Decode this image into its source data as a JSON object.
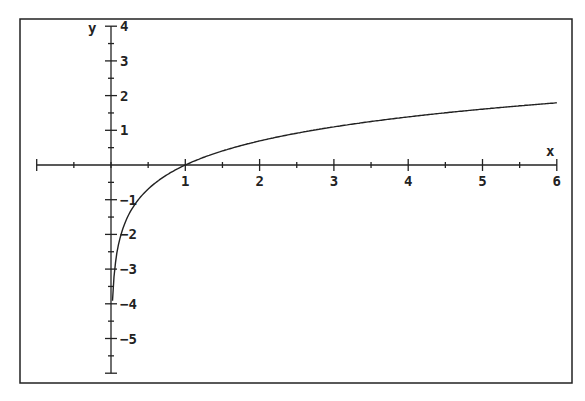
{
  "chart_data": {
    "type": "line",
    "title": "",
    "xlabel": "x",
    "ylabel": "y",
    "function": "y = ln(x)",
    "xlim": [
      -1,
      6
    ],
    "ylim": [
      -6,
      4
    ],
    "x_ticks": [
      1,
      2,
      3,
      4,
      5,
      6
    ],
    "y_ticks": [
      4,
      3,
      2,
      1,
      -1,
      -2,
      -3,
      -4,
      -5
    ],
    "x_tick_labels": [
      "1",
      "2",
      "3",
      "4",
      "5",
      "6"
    ],
    "y_tick_labels": [
      "4",
      "3",
      "2",
      "1",
      "-1",
      "-2",
      "-3",
      "-4",
      "-5"
    ],
    "minor_ticks": "every 0.5 unit",
    "grid": false,
    "legend": null,
    "series": [
      {
        "name": "ln(x)",
        "x": [
          0.02,
          0.05,
          0.1,
          0.2,
          0.3,
          0.5,
          0.75,
          1,
          1.5,
          2,
          3,
          4,
          5,
          6
        ],
        "values": [
          -3.91,
          -3.0,
          -2.3,
          -1.61,
          -1.2,
          -0.69,
          -0.29,
          0,
          0.41,
          0.69,
          1.1,
          1.39,
          1.61,
          1.79
        ]
      }
    ],
    "colors": {
      "axis": "#222222",
      "curve": "#222222",
      "frame": "#222222",
      "background": "#ffffff"
    }
  }
}
